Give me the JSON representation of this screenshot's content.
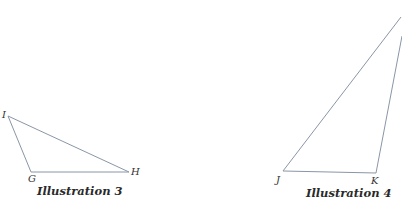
{
  "figures": [
    {
      "caption": "Illustration 3",
      "vertices": [
        {
          "label": "I",
          "x": 8,
          "y": 116
        },
        {
          "label": "G",
          "x": 31,
          "y": 172
        },
        {
          "label": "H",
          "x": 129,
          "y": 172
        }
      ]
    },
    {
      "caption": "Illustration 4",
      "vertices": [
        {
          "label": "J",
          "x": 283,
          "y": 171
        },
        {
          "label": "K",
          "x": 376,
          "y": 173
        }
      ]
    }
  ],
  "colors": {
    "edge": "#8a96a6",
    "text": "#2a2a2a"
  }
}
